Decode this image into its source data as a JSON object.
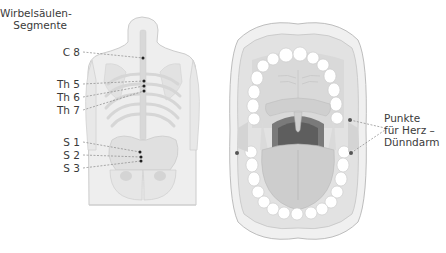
{
  "back_figure": {
    "title_line1": "Wirbelsäulen-",
    "title_line2": "Segmente",
    "labels": [
      {
        "text": "C 8",
        "x": 50,
        "y": 52,
        "px": 143,
        "py": 58
      },
      {
        "text": "Th 5",
        "x": 45,
        "y": 84,
        "px": 144,
        "py": 81
      },
      {
        "text": "Th 6",
        "x": 45,
        "y": 97,
        "px": 144,
        "py": 86
      },
      {
        "text": "Th 7",
        "x": 45,
        "y": 110,
        "px": 144,
        "py": 91
      },
      {
        "text": "S 1",
        "x": 50,
        "y": 142,
        "px": 140,
        "py": 152
      },
      {
        "text": "S 2",
        "x": 50,
        "y": 155,
        "px": 141,
        "py": 157
      },
      {
        "text": "S 3",
        "x": 50,
        "y": 168,
        "px": 141,
        "py": 161
      }
    ]
  },
  "mouth_figure": {
    "label_line1": "Punkte",
    "label_line2": "für Herz –",
    "label_line3": "Dünndarm"
  },
  "colors": {
    "body_fill": "#ececec",
    "body_stroke": "#c8c8c8",
    "bone": "#dcdcdc",
    "point": "#222222",
    "leader": "#888888",
    "teeth": "#ffffff",
    "mouth_dark": "#7a7a7a"
  }
}
